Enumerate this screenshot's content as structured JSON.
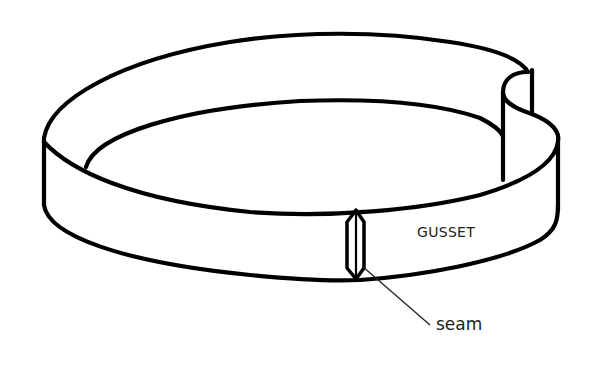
{
  "diagram": {
    "labels": {
      "gusset": "GUSSET",
      "seam": "seam"
    },
    "colors": {
      "line": "#000000",
      "text": "#222222",
      "background": "#ffffff"
    }
  }
}
